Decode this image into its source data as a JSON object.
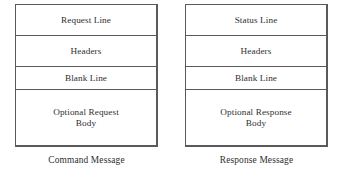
{
  "diagram": {
    "type": "http-message-structure",
    "blocks": [
      {
        "id": "command",
        "caption": "Command Message",
        "sections": [
          {
            "label": "Request Line"
          },
          {
            "label": "Headers"
          },
          {
            "label": "Blank Line"
          },
          {
            "label": "Optional Request\nBody"
          }
        ]
      },
      {
        "id": "response",
        "caption": "Response Message",
        "sections": [
          {
            "label": "Status Line"
          },
          {
            "label": "Headers"
          },
          {
            "label": "Blank Line"
          },
          {
            "label": "Optional Response\nBody"
          }
        ]
      }
    ],
    "colors": {
      "background": "#ffffff",
      "border": "#5a5a5a",
      "text": "#2f2f2f"
    }
  }
}
